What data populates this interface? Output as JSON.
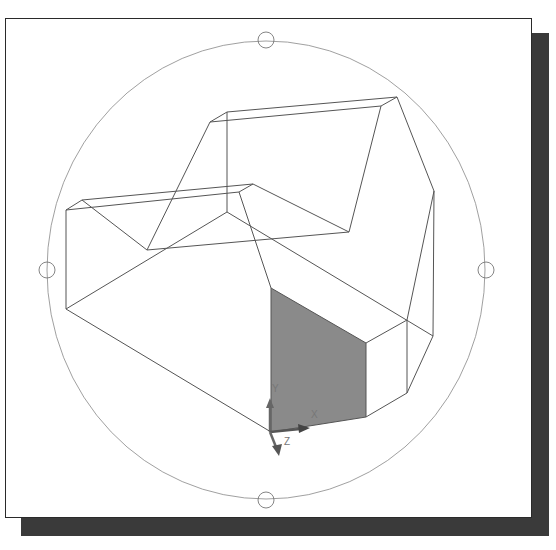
{
  "viewport": {
    "mode": "3D Orbit",
    "visual_style": "wireframe",
    "highlight_color": "#8a8a8a",
    "edge_color": "#555555",
    "shadow_color": "#3a3a3a"
  },
  "orbit": {
    "center": [
      266,
      270
    ],
    "radius_x": 219,
    "radius_y": 229,
    "grips": [
      {
        "name": "top",
        "x": 266,
        "y": 40
      },
      {
        "name": "left",
        "x": 47,
        "y": 270
      },
      {
        "name": "right",
        "x": 486,
        "y": 270
      },
      {
        "name": "bottom",
        "x": 266,
        "y": 500
      }
    ]
  },
  "ucs_icon": {
    "origin": [
      270,
      432
    ],
    "labels": {
      "x": "X",
      "y": "Y",
      "z": "Z"
    }
  },
  "model": {
    "selected_face": "front-face"
  }
}
